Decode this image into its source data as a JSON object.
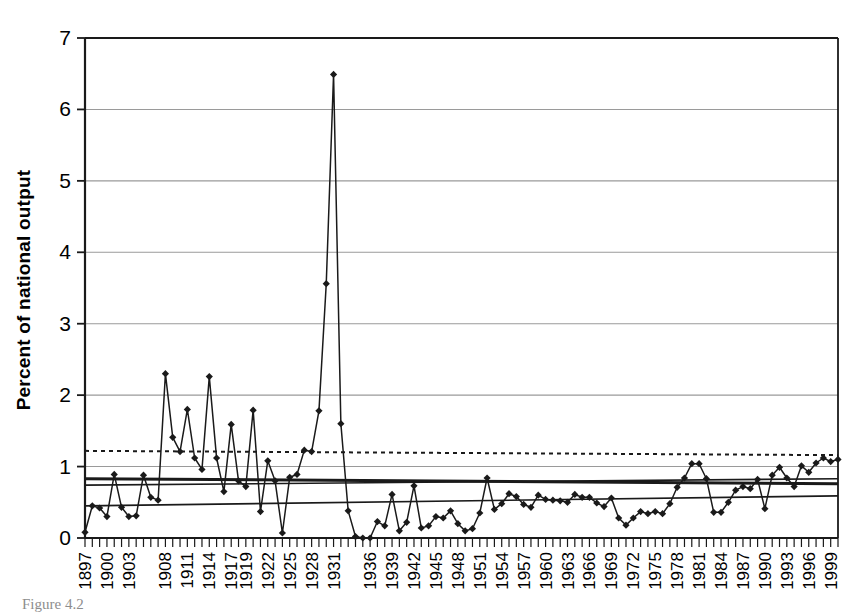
{
  "figure": {
    "caption": "Figure 4.2",
    "background_color": "#ffffff",
    "ink_color": "#1a1a1a",
    "gridline_color": "#9a9a9a"
  },
  "chart_data": {
    "type": "line",
    "title": "",
    "subtitle": "",
    "xlabel": "",
    "ylabel": "Percent of national output",
    "ylim": [
      0,
      7
    ],
    "yticks": [
      0,
      1,
      2,
      3,
      4,
      5,
      6,
      7
    ],
    "ytick_labels": [
      "0",
      "1",
      "2",
      "3",
      "4",
      "5",
      "6",
      "7"
    ],
    "grid": true,
    "grid_axis": "y",
    "legend": null,
    "legend_position": "none",
    "marker": "diamond",
    "xlim": [
      1897,
      2000
    ],
    "xtick_labels": [
      "1897",
      "1900",
      "1903",
      "1908",
      "1911",
      "1914",
      "1917",
      "1919",
      "1922",
      "1925",
      "1928",
      "1931",
      "1936",
      "1939",
      "1942",
      "1945",
      "1948",
      "1951",
      "1954",
      "1957",
      "1960",
      "1963",
      "1966",
      "1969",
      "1972",
      "1975",
      "1978",
      "1981",
      "1984",
      "1987",
      "1990",
      "1993",
      "1996",
      "1999"
    ],
    "x": [
      1897,
      1898,
      1899,
      1900,
      1901,
      1902,
      1903,
      1904,
      1905,
      1906,
      1907,
      1908,
      1909,
      1910,
      1911,
      1912,
      1913,
      1914,
      1915,
      1916,
      1917,
      1918,
      1919,
      1920,
      1921,
      1922,
      1923,
      1924,
      1925,
      1926,
      1927,
      1928,
      1929,
      1930,
      1931,
      1932,
      1933,
      1934,
      1935,
      1936,
      1937,
      1938,
      1939,
      1940,
      1941,
      1942,
      1943,
      1944,
      1945,
      1946,
      1947,
      1948,
      1949,
      1950,
      1951,
      1952,
      1953,
      1954,
      1955,
      1956,
      1957,
      1958,
      1959,
      1960,
      1961,
      1962,
      1963,
      1964,
      1965,
      1966,
      1967,
      1968,
      1969,
      1970,
      1971,
      1972,
      1973,
      1974,
      1975,
      1976,
      1977,
      1978,
      1979,
      1980,
      1981,
      1982,
      1983,
      1984,
      1985,
      1986,
      1987,
      1988,
      1989,
      1990,
      1991,
      1992,
      1993,
      1994,
      1995,
      1996,
      1997,
      1998,
      1999,
      2000
    ],
    "values": [
      0.08,
      0.45,
      0.42,
      0.3,
      0.89,
      0.43,
      0.3,
      0.31,
      0.88,
      0.57,
      0.53,
      2.3,
      1.41,
      1.21,
      1.8,
      1.12,
      0.96,
      2.26,
      1.12,
      0.65,
      1.59,
      0.8,
      0.72,
      1.79,
      0.37,
      1.08,
      0.8,
      0.07,
      0.85,
      0.89,
      1.23,
      1.21,
      1.78,
      3.56,
      6.49,
      1.6,
      0.38,
      0.02,
      0.0,
      0.0,
      0.23,
      0.17,
      0.61,
      0.1,
      0.22,
      0.73,
      0.14,
      0.17,
      0.3,
      0.28,
      0.38,
      0.2,
      0.1,
      0.13,
      0.35,
      0.84,
      0.4,
      0.48,
      0.62,
      0.58,
      0.47,
      0.43,
      0.6,
      0.54,
      0.53,
      0.52,
      0.5,
      0.61,
      0.57,
      0.57,
      0.49,
      0.44,
      0.56,
      0.28,
      0.18,
      0.28,
      0.37,
      0.34,
      0.37,
      0.34,
      0.48,
      0.71,
      0.84,
      1.04,
      1.04,
      0.83,
      0.36,
      0.36,
      0.5,
      0.67,
      0.72,
      0.69,
      0.82,
      0.41,
      0.88,
      0.99,
      0.84,
      0.72,
      1.01,
      0.92,
      1.05,
      1.12,
      1.07,
      1.1
    ],
    "reference_lines": [
      {
        "name": "upper-dotted-trend",
        "style": "dotted",
        "y_start": 1.22,
        "y_end": 1.16,
        "width": 2
      },
      {
        "name": "thick-solid-trend",
        "style": "solid",
        "y_start": 0.83,
        "y_end": 0.76,
        "width": 3
      },
      {
        "name": "thin-solid-trend-mid",
        "style": "solid",
        "y_start": 0.74,
        "y_end": 0.83,
        "width": 1.6
      },
      {
        "name": "thin-solid-trend-lower",
        "style": "solid",
        "y_start": 0.45,
        "y_end": 0.59,
        "width": 1.6
      }
    ]
  }
}
